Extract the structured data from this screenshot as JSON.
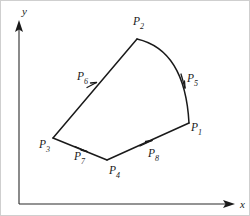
{
  "figure": {
    "background_color": "#ffffff",
    "line_color": "#1a1a1a",
    "axis_color": "#2b2b2b",
    "width": 250,
    "height": 216
  },
  "axes": {
    "origin": {
      "x": 18,
      "y": 203
    },
    "x_axis": {
      "label": "x",
      "label_x": 239,
      "label_y": 206,
      "start_x": 18,
      "end_x": 233,
      "y": 203
    },
    "y_axis": {
      "label": "y",
      "label_x": 20,
      "label_y": 14,
      "start_y": 203,
      "end_y": 22,
      "x": 18
    }
  },
  "shape": {
    "type": "closed-polygon-with-curved-edge",
    "vertices": [
      {
        "name": "P",
        "subscript": "1",
        "x": 188,
        "y": 122,
        "label_x": 192,
        "label_y": 130
      },
      {
        "name": "P",
        "subscript": "2",
        "x": 136,
        "y": 38,
        "label_x": 133,
        "label_y": 24
      },
      {
        "name": "P",
        "subscript": "3",
        "x": 52,
        "y": 137,
        "label_x": 40,
        "label_y": 147
      },
      {
        "name": "P",
        "subscript": "4",
        "x": 106,
        "y": 159,
        "label_x": 111,
        "label_y": 173
      }
    ],
    "edges": [
      {
        "name": "P",
        "subscript": "5",
        "from": "P2",
        "to": "P1",
        "curved": true,
        "label_x": 189,
        "label_y": 81,
        "marker_x": 182,
        "marker_y": 80
      },
      {
        "name": "P",
        "subscript": "6",
        "from": "P3",
        "to": "P2",
        "curved": false,
        "label_x": 78,
        "label_y": 79,
        "marker_x": 91,
        "marker_y": 84
      },
      {
        "name": "P",
        "subscript": "7",
        "from": "P3",
        "to": "P4",
        "curved": false,
        "label_x": 75,
        "label_y": 159,
        "marker_x": 80,
        "marker_y": 148
      },
      {
        "name": "P",
        "subscript": "8",
        "from": "P4",
        "to": "P1",
        "curved": false,
        "label_x": 150,
        "label_y": 156,
        "marker_x": 145,
        "marker_y": 142
      }
    ]
  }
}
